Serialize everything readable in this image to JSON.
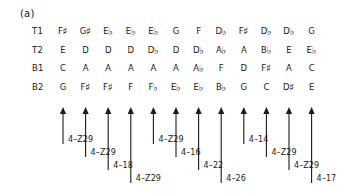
{
  "figure": {
    "panel_label": "(a)",
    "voice_labels": [
      "T1",
      "T2",
      "B1",
      "B2"
    ],
    "rows": [
      {
        "voice": "T1",
        "notes": [
          {
            "letter": "F",
            "accidental": "♯"
          },
          {
            "letter": "G",
            "accidental": "♯"
          },
          {
            "letter": "E",
            "accidental": "♭"
          },
          {
            "letter": "E",
            "accidental": "♭"
          },
          {
            "letter": "E",
            "accidental": "♭"
          },
          {
            "letter": "G",
            "accidental": ""
          },
          {
            "letter": "F",
            "accidental": ""
          },
          {
            "letter": "D",
            "accidental": "♭"
          },
          {
            "letter": "F",
            "accidental": "♯"
          },
          {
            "letter": "D",
            "accidental": "♭"
          },
          {
            "letter": "D",
            "accidental": "♭"
          },
          {
            "letter": "G",
            "accidental": ""
          }
        ]
      },
      {
        "voice": "T2",
        "notes": [
          {
            "letter": "E",
            "accidental": ""
          },
          {
            "letter": "D",
            "accidental": ""
          },
          {
            "letter": "D",
            "accidental": ""
          },
          {
            "letter": "D",
            "accidental": ""
          },
          {
            "letter": "D",
            "accidental": "♭"
          },
          {
            "letter": "D",
            "accidental": ""
          },
          {
            "letter": "D",
            "accidental": "♭"
          },
          {
            "letter": "A",
            "accidental": "♭"
          },
          {
            "letter": "A",
            "accidental": ""
          },
          {
            "letter": "B",
            "accidental": "♭"
          },
          {
            "letter": "E",
            "accidental": ""
          },
          {
            "letter": "E",
            "accidental": "♭"
          }
        ]
      },
      {
        "voice": "B1",
        "notes": [
          {
            "letter": "C",
            "accidental": ""
          },
          {
            "letter": "A",
            "accidental": ""
          },
          {
            "letter": "A",
            "accidental": ""
          },
          {
            "letter": "A",
            "accidental": ""
          },
          {
            "letter": "A",
            "accidental": ""
          },
          {
            "letter": "A",
            "accidental": ""
          },
          {
            "letter": "A",
            "accidental": "♭"
          },
          {
            "letter": "F",
            "accidental": ""
          },
          {
            "letter": "D",
            "accidental": ""
          },
          {
            "letter": "F",
            "accidental": "♯"
          },
          {
            "letter": "A",
            "accidental": ""
          },
          {
            "letter": "C",
            "accidental": ""
          }
        ]
      },
      {
        "voice": "B2",
        "notes": [
          {
            "letter": "G",
            "accidental": ""
          },
          {
            "letter": "F",
            "accidental": "♯"
          },
          {
            "letter": "F",
            "accidental": "♯"
          },
          {
            "letter": "F",
            "accidental": ""
          },
          {
            "letter": "F",
            "accidental": "♭"
          },
          {
            "letter": "E",
            "accidental": "♭"
          },
          {
            "letter": "E",
            "accidental": "♭"
          },
          {
            "letter": "B",
            "accidental": "♭"
          },
          {
            "letter": "G",
            "accidental": ""
          },
          {
            "letter": "C",
            "accidental": ""
          },
          {
            "letter": "D",
            "accidental": "♯"
          },
          {
            "letter": "E",
            "accidental": ""
          }
        ]
      }
    ],
    "set_class_annotations": [
      {
        "index": 0,
        "label": "4–Z29",
        "tier": 3
      },
      {
        "index": 1,
        "label": "4–Z29",
        "tier": 2
      },
      {
        "index": 2,
        "label": "4–18",
        "tier": 1
      },
      {
        "index": 3,
        "label": "4–Z29",
        "tier": 0
      },
      {
        "index": 4,
        "label": "4–Z29",
        "tier": 3
      },
      {
        "index": 5,
        "label": "4–16",
        "tier": 2
      },
      {
        "index": 6,
        "label": "4–22",
        "tier": 1
      },
      {
        "index": 7,
        "label": "4–26",
        "tier": 0
      },
      {
        "index": 8,
        "label": "4–14",
        "tier": 3
      },
      {
        "index": 9,
        "label": "4–Z29",
        "tier": 2
      },
      {
        "index": 10,
        "label": "4–Z29",
        "tier": 1
      },
      {
        "index": 11,
        "label": "4–17",
        "tier": 0
      }
    ],
    "arrow_color": "#1a1a1a"
  }
}
